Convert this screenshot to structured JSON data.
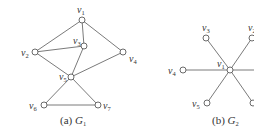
{
  "figure": {
    "graphs": [
      {
        "id": "G1",
        "caption": {
          "prefix": "(a) ",
          "name": "G",
          "sub": "1"
        },
        "nodes": [
          {
            "id": "v1",
            "label": "v",
            "sub": "1",
            "x": 82,
            "y": 20
          },
          {
            "id": "v2",
            "label": "v",
            "sub": "2",
            "x": 35,
            "y": 52
          },
          {
            "id": "v3",
            "label": "v",
            "sub": "3",
            "x": 84,
            "y": 46
          },
          {
            "id": "v4",
            "label": "v",
            "sub": "4",
            "x": 123,
            "y": 52
          },
          {
            "id": "v5",
            "label": "v",
            "sub": "5",
            "x": 71,
            "y": 77
          },
          {
            "id": "v6",
            "label": "v",
            "sub": "6",
            "x": 44,
            "y": 105
          },
          {
            "id": "v7",
            "label": "v",
            "sub": "7",
            "x": 98,
            "y": 105
          }
        ],
        "edges": [
          [
            "v1",
            "v2"
          ],
          [
            "v1",
            "v3"
          ],
          [
            "v1",
            "v4"
          ],
          [
            "v2",
            "v3"
          ],
          [
            "v2",
            "v5"
          ],
          [
            "v3",
            "v5"
          ],
          [
            "v5",
            "v4"
          ],
          [
            "v5",
            "v6"
          ],
          [
            "v5",
            "v7"
          ],
          [
            "v6",
            "v7"
          ]
        ]
      },
      {
        "id": "G2",
        "caption": {
          "prefix": "(b) ",
          "name": "G",
          "sub": "2"
        },
        "nodes": [
          {
            "id": "v1",
            "label": "v",
            "sub": "1",
            "x": 230,
            "y": 70
          },
          {
            "id": "v3",
            "label": "v",
            "sub": "3",
            "x": 206,
            "y": 38
          },
          {
            "id": "v2",
            "label": "v",
            "sub": "2",
            "x": 252,
            "y": 38
          },
          {
            "id": "v4",
            "label": "v",
            "sub": "4",
            "x": 183,
            "y": 70
          },
          {
            "id": "v5",
            "label": "v",
            "sub": "5",
            "x": 207,
            "y": 103
          },
          {
            "id": "v6",
            "label": "",
            "sub": "",
            "x": 253,
            "y": 103
          },
          {
            "id": "v7",
            "label": "",
            "sub": "",
            "x": 258,
            "y": 70
          }
        ],
        "edges": [
          [
            "v1",
            "v3"
          ],
          [
            "v1",
            "v2"
          ],
          [
            "v1",
            "v4"
          ],
          [
            "v1",
            "v5"
          ],
          [
            "v1",
            "v6"
          ],
          [
            "v1",
            "v7"
          ]
        ]
      }
    ]
  }
}
